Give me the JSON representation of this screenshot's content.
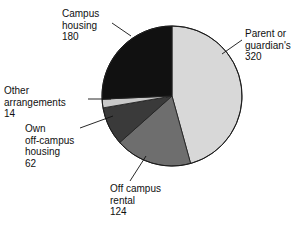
{
  "chart_data": {
    "type": "pie",
    "title": "",
    "subtitle": "",
    "xlabel": "",
    "ylabel": "",
    "total": 700,
    "legend_position": "none",
    "grid": false,
    "start_angle_deg": 0,
    "direction": "clockwise",
    "categories": [
      "Parent or guardian's",
      "Off campus rental",
      "Own off-campus housing",
      "Other arrangements",
      "Campus housing"
    ],
    "values": [
      320,
      124,
      62,
      14,
      180
    ],
    "colors": [
      "#d8d8d8",
      "#6e6e6e",
      "#3a3a3a",
      "#c9c9c9",
      "#111111"
    ],
    "slices": [
      {
        "label": "Parent or guardian's",
        "value": 320,
        "color": "#d8d8d8",
        "percent": 45.7,
        "angle_deg": 164.6
      },
      {
        "label": "Off campus rental",
        "value": 124,
        "color": "#6e6e6e",
        "percent": 17.7,
        "angle_deg": 63.8
      },
      {
        "label": "Own off-campus housing",
        "value": 62,
        "color": "#3a3a3a",
        "percent": 8.9,
        "angle_deg": 31.9
      },
      {
        "label": "Other arrangements",
        "value": 14,
        "color": "#c9c9c9",
        "percent": 2.0,
        "angle_deg": 7.2
      },
      {
        "label": "Campus housing",
        "value": 180,
        "color": "#111111",
        "percent": 25.7,
        "angle_deg": 92.6
      }
    ]
  },
  "labels": {
    "parent_guardian": "Parent or\nguardian's\n320",
    "campus_housing": "Campus\nhousing\n180",
    "other_arrangements": "Other\narrangements\n14",
    "own_off_campus": "Own\noff-campus\nhousing\n62",
    "off_campus_rental": "Off campus\nrental\n124"
  }
}
